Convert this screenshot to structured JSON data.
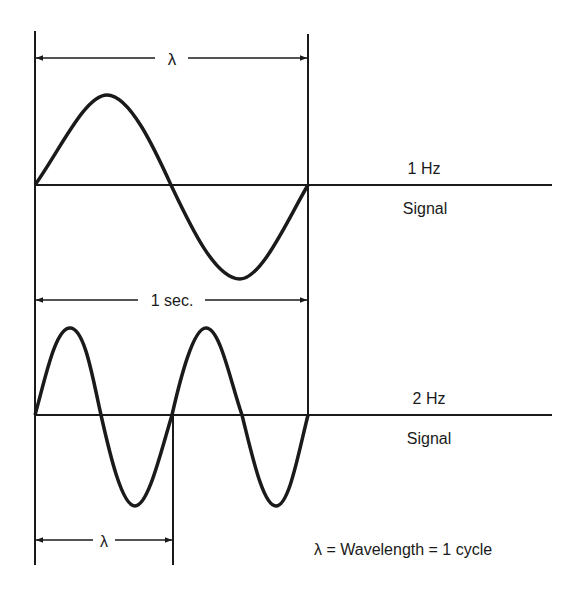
{
  "diagram": {
    "top_wavelength_label": "λ",
    "one_sec_label": "1 sec.",
    "bottom_wavelength_label": "λ",
    "signal_1": {
      "frequency": "1 Hz",
      "caption": "Signal"
    },
    "signal_2": {
      "frequency": "2 Hz",
      "caption": "Signal"
    },
    "legend": "λ = Wavelength = 1 cycle"
  },
  "colors": {
    "ink": "#1a1a1a",
    "background": "#ffffff"
  }
}
